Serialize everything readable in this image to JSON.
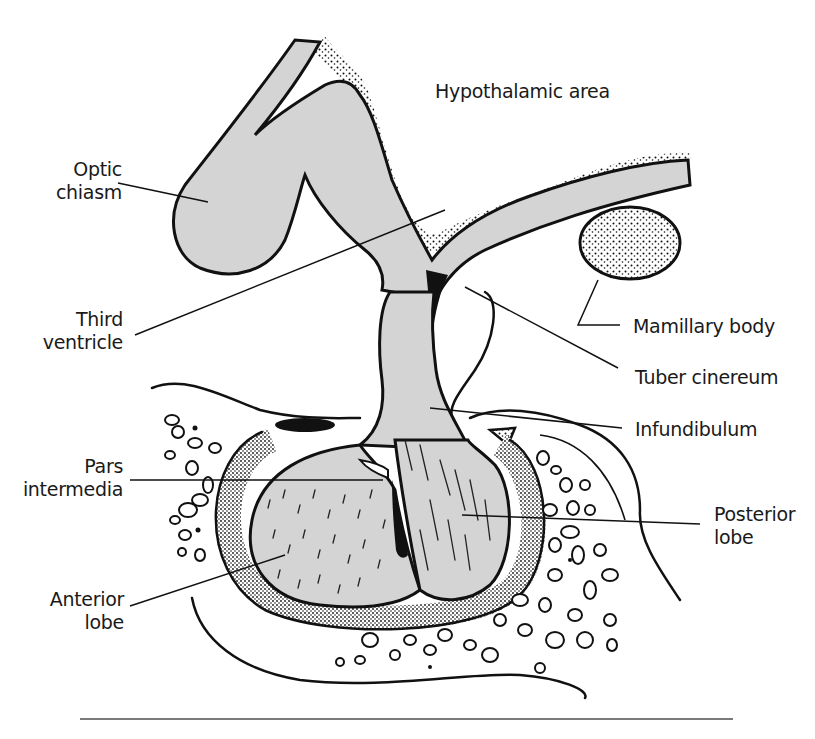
{
  "figure": {
    "colors": {
      "tissue_fill": "#d4d4d4",
      "outline": "#111111",
      "background": "#ffffff",
      "rule": "#7a7a7a"
    },
    "labels": {
      "hypothalamic_area": "Hypothalamic area",
      "optic_chiasm": {
        "line1": "Optic",
        "line2": "chiasm"
      },
      "third_ventricle": {
        "line1": "Third",
        "line2": "ventricle"
      },
      "mamillary_body": "Mamillary body",
      "tuber_cinereum": "Tuber cinereum",
      "infundibulum": "Infundibulum",
      "pars_intermedia": {
        "line1": "Pars",
        "line2": "intermedia"
      },
      "posterior_lobe": {
        "line1": "Posterior",
        "line2": "lobe"
      },
      "anterior_lobe": {
        "line1": "Anterior",
        "line2": "lobe"
      }
    }
  }
}
